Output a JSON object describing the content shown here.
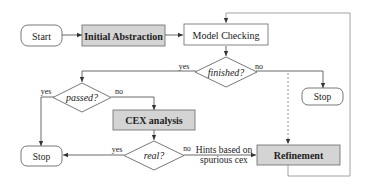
{
  "diagram": {
    "type": "flowchart",
    "nodes": {
      "start": {
        "label": "Start",
        "shape": "terminal"
      },
      "initial_abstraction": {
        "label": "Initial Abstraction",
        "shape": "process",
        "fill": "#d4d4d4"
      },
      "model_checking": {
        "label": "Model Checking",
        "shape": "process",
        "fill": "#ffffff"
      },
      "finished": {
        "label": "finished?",
        "shape": "decision"
      },
      "stop_right": {
        "label": "Stop",
        "shape": "terminal"
      },
      "passed": {
        "label": "passed?",
        "shape": "decision"
      },
      "cex_analysis": {
        "label": "CEX analysis",
        "shape": "process",
        "fill": "#d4d4d4"
      },
      "stop_left": {
        "label": "Stop",
        "shape": "terminal"
      },
      "real": {
        "label": "real?",
        "shape": "decision"
      },
      "refinement": {
        "label": "Refinement",
        "shape": "process",
        "fill": "#d4d4d4"
      }
    },
    "edge_labels": {
      "finished_yes": "yes",
      "finished_no": "no",
      "passed_yes": "yes",
      "passed_no": "no",
      "real_yes": "yes",
      "real_no": "no",
      "hints_line1": "Hints based on",
      "hints_line2": "spurious cex"
    },
    "edges": [
      {
        "from": "start",
        "to": "initial_abstraction"
      },
      {
        "from": "initial_abstraction",
        "to": "model_checking"
      },
      {
        "from": "model_checking",
        "to": "finished"
      },
      {
        "from": "finished",
        "to": "passed",
        "label": "yes"
      },
      {
        "from": "finished",
        "to": "stop_right",
        "label": "no"
      },
      {
        "from": "finished",
        "to": "refinement",
        "style": "dashed"
      },
      {
        "from": "passed",
        "to": "stop_left",
        "label": "yes"
      },
      {
        "from": "passed",
        "to": "cex_analysis",
        "label": "no"
      },
      {
        "from": "cex_analysis",
        "to": "real"
      },
      {
        "from": "real",
        "to": "stop_left",
        "label": "yes"
      },
      {
        "from": "real",
        "to": "refinement",
        "label": "no / Hints based on spurious cex"
      },
      {
        "from": "refinement",
        "to": "model_checking"
      }
    ],
    "colors": {
      "line": "#444444",
      "gray_fill": "#d4d4d4",
      "feedback_line": "#8a8a8a"
    }
  }
}
